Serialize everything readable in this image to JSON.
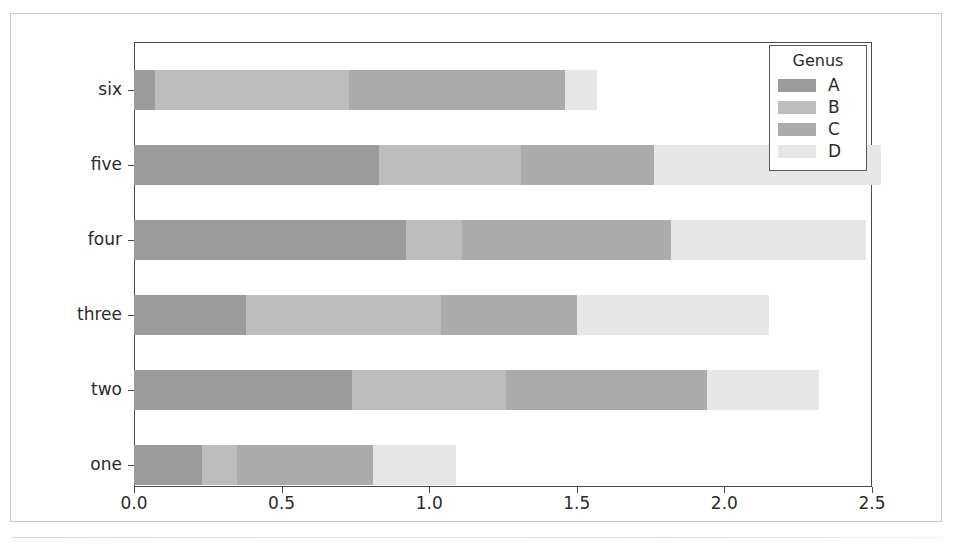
{
  "figure": {
    "background": "#ffffff",
    "frame_color": "#c9c9c9",
    "axis_color": "#4a4a4a"
  },
  "legend": {
    "title": "Genus",
    "position": "upper right",
    "entries": [
      {
        "label": "A",
        "color": "#9b9b9b"
      },
      {
        "label": "B",
        "color": "#bdbdbd"
      },
      {
        "label": "C",
        "color": "#ababab"
      },
      {
        "label": "D",
        "color": "#e7e7e7"
      }
    ]
  },
  "chart_data": {
    "type": "bar",
    "orientation": "horizontal",
    "stacked": true,
    "title": "",
    "xlabel": "",
    "ylabel": "",
    "xlim": [
      0.0,
      2.5
    ],
    "ylim_categories": [
      "one",
      "two",
      "three",
      "four",
      "five",
      "six"
    ],
    "grid": false,
    "legend_title": "Genus",
    "legend_position": "upper right",
    "xticks": [
      0.0,
      0.5,
      1.0,
      1.5,
      2.0,
      2.5
    ],
    "xticklabels": [
      "0.0",
      "0.5",
      "1.0",
      "1.5",
      "2.0",
      "2.5"
    ],
    "categories": [
      "six",
      "five",
      "four",
      "three",
      "two",
      "one"
    ],
    "series": [
      {
        "name": "A",
        "color": "#9b9b9b",
        "values": [
          0.07,
          0.83,
          0.92,
          0.38,
          0.74,
          0.23
        ]
      },
      {
        "name": "B",
        "color": "#bdbdbd",
        "values": [
          0.66,
          0.48,
          0.19,
          0.66,
          0.52,
          0.12
        ]
      },
      {
        "name": "C",
        "color": "#ababab",
        "values": [
          0.73,
          0.45,
          0.71,
          0.46,
          0.68,
          0.46
        ]
      },
      {
        "name": "D",
        "color": "#e7e7e7",
        "values": [
          0.11,
          0.77,
          0.66,
          0.65,
          0.38,
          0.28
        ]
      }
    ],
    "totals": [
      1.57,
      2.53,
      2.48,
      2.15,
      2.32,
      1.09
    ]
  }
}
